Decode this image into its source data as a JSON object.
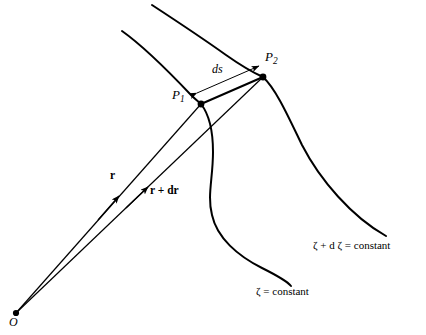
{
  "figure": {
    "background_color": "#ffffff",
    "stroke_color": "#000000"
  },
  "points": {
    "origin": {
      "label": "O",
      "style": "italic",
      "x": 16,
      "y": 313
    },
    "p1": {
      "label": "P",
      "subscript": "1",
      "x": 201,
      "y": 104
    },
    "p2": {
      "label": "P",
      "subscript": "2",
      "x": 263,
      "y": 77
    }
  },
  "vectors": [
    {
      "name": "position-vector-r",
      "label": "r",
      "style": "bold",
      "from": "O",
      "to": "P1"
    },
    {
      "name": "position-vector-r-plus-dr",
      "label": "r + dr",
      "style": "bold",
      "from": "O",
      "to": "P2"
    }
  ],
  "measurements": [
    {
      "name": "arc-length",
      "label": "ds",
      "style": "italic",
      "kind": "double-headed-arrow",
      "from": "P1",
      "to": "P2"
    }
  ],
  "curves": [
    {
      "name": "zeta-constant-curve",
      "label": "ζ = constant"
    },
    {
      "name": "zeta-plus-dzeta-constant-curve",
      "label": "ζ + d ζ = constant"
    }
  ],
  "labels": {
    "p1": "P",
    "p1_sub": "1",
    "p2": "P",
    "p2_sub": "2",
    "ds": "ds",
    "r": "r",
    "r_plus_dr": "r + dr",
    "origin": "O",
    "zeta_constant": "ζ = constant",
    "zeta_plus_dzeta_constant": "ζ + d ζ = constant"
  }
}
